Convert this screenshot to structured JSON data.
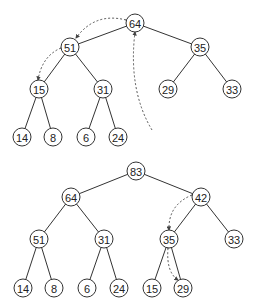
{
  "colors": {
    "stroke": "#333333",
    "fill": "#ffffff",
    "text": "#222222"
  },
  "trees": [
    {
      "name": "heap-before",
      "nodes": [
        {
          "id": "a0",
          "label": "64",
          "x": 135,
          "y": 23
        },
        {
          "id": "a1",
          "label": "51",
          "x": 70,
          "y": 47
        },
        {
          "id": "a2",
          "label": "35",
          "x": 200,
          "y": 47
        },
        {
          "id": "a3",
          "label": "15",
          "x": 39,
          "y": 89
        },
        {
          "id": "a4",
          "label": "31",
          "x": 103,
          "y": 89
        },
        {
          "id": "a5",
          "label": "29",
          "x": 168,
          "y": 89
        },
        {
          "id": "a6",
          "label": "33",
          "x": 232,
          "y": 89
        },
        {
          "id": "a7",
          "label": "14",
          "x": 22,
          "y": 137
        },
        {
          "id": "a8",
          "label": "8",
          "x": 53,
          "y": 137
        },
        {
          "id": "a9",
          "label": "6",
          "x": 86,
          "y": 137
        },
        {
          "id": "a10",
          "label": "24",
          "x": 118,
          "y": 137
        }
      ],
      "edges": [
        [
          "a0",
          "a1"
        ],
        [
          "a0",
          "a2"
        ],
        [
          "a1",
          "a3"
        ],
        [
          "a1",
          "a4"
        ],
        [
          "a2",
          "a5"
        ],
        [
          "a2",
          "a6"
        ],
        [
          "a3",
          "a7"
        ],
        [
          "a3",
          "a8"
        ],
        [
          "a4",
          "a9"
        ],
        [
          "a4",
          "a10"
        ]
      ],
      "arrows": [
        {
          "name": "swap-arrow-64-51",
          "d": "M 126 20 Q 95 12 76 38"
        },
        {
          "name": "swap-arrow-51-15",
          "d": "M 61 48 Q 42 56 38 80"
        },
        {
          "name": "insert-arrow-to-root",
          "d": "M 152 130 Q 128 90 135 32"
        }
      ]
    },
    {
      "name": "heap-after",
      "nodes": [
        {
          "id": "b0",
          "label": "83",
          "x": 136,
          "y": 171
        },
        {
          "id": "b1",
          "label": "64",
          "x": 71,
          "y": 197
        },
        {
          "id": "b2",
          "label": "42",
          "x": 201,
          "y": 197
        },
        {
          "id": "b3",
          "label": "51",
          "x": 39,
          "y": 239
        },
        {
          "id": "b4",
          "label": "31",
          "x": 104,
          "y": 239
        },
        {
          "id": "b5",
          "label": "35",
          "x": 169,
          "y": 239
        },
        {
          "id": "b6",
          "label": "33",
          "x": 234,
          "y": 239
        },
        {
          "id": "b7",
          "label": "14",
          "x": 23,
          "y": 288
        },
        {
          "id": "b8",
          "label": "8",
          "x": 54,
          "y": 288
        },
        {
          "id": "b9",
          "label": "6",
          "x": 87,
          "y": 288
        },
        {
          "id": "b10",
          "label": "24",
          "x": 119,
          "y": 288
        },
        {
          "id": "b11",
          "label": "15",
          "x": 152,
          "y": 288
        },
        {
          "id": "b12",
          "label": "29",
          "x": 183,
          "y": 288
        }
      ],
      "edges": [
        [
          "b0",
          "b1"
        ],
        [
          "b0",
          "b2"
        ],
        [
          "b1",
          "b3"
        ],
        [
          "b1",
          "b4"
        ],
        [
          "b2",
          "b5"
        ],
        [
          "b2",
          "b6"
        ],
        [
          "b3",
          "b7"
        ],
        [
          "b3",
          "b8"
        ],
        [
          "b4",
          "b9"
        ],
        [
          "b4",
          "b10"
        ],
        [
          "b5",
          "b11"
        ],
        [
          "b5",
          "b12"
        ]
      ],
      "arrows": [
        {
          "name": "swap-arrow-42-35",
          "d": "M 192 195 Q 168 205 169 230"
        },
        {
          "name": "swap-arrow-35-29",
          "d": "M 168 248 Q 166 272 178 280"
        }
      ]
    }
  ]
}
